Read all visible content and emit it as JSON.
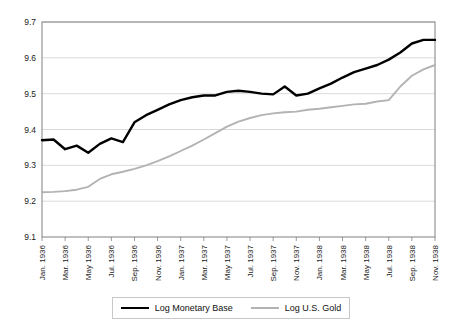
{
  "chart_data": {
    "type": "line",
    "title": "",
    "xlabel": "",
    "ylabel": "",
    "ylim": [
      9.1,
      9.7
    ],
    "yticks": [
      "9.1",
      "9.2",
      "9.3",
      "9.4",
      "9.5",
      "9.6",
      "9.7"
    ],
    "grid": true,
    "legend_position": "bottom",
    "x": [
      "Jan. 1936",
      "Feb. 1936",
      "Mar. 1936",
      "Apr. 1936",
      "May 1936",
      "Jun. 1936",
      "Jul. 1936",
      "Aug. 1936",
      "Sep. 1936",
      "Oct. 1936",
      "Nov. 1936",
      "Dec. 1936",
      "Jan. 1937",
      "Feb. 1937",
      "Mar. 1937",
      "Apr. 1937",
      "May 1937",
      "Jun. 1937",
      "Jul. 1937",
      "Aug. 1937",
      "Sep. 1937",
      "Oct. 1937",
      "Nov. 1937",
      "Dec. 1937",
      "Jan. 1938",
      "Feb. 1938",
      "Mar. 1938",
      "Apr. 1938",
      "May 1938",
      "Jun. 1938",
      "Jul. 1938",
      "Aug. 1938",
      "Sep. 1938",
      "Oct. 1938",
      "Nov. 1938"
    ],
    "xtick_labels": [
      "Jan. 1936",
      "Mar. 1936",
      "May 1936",
      "Jul. 1936",
      "Sep. 1936",
      "Nov. 1936",
      "Jan. 1937",
      "Mar. 1937",
      "May 1937",
      "Jul. 1937",
      "Sep. 1937",
      "Nov. 1937",
      "Jan. 1938",
      "Mar. 1938",
      "May 1938",
      "Jul. 1938",
      "Sep. 1938",
      "Nov. 1938"
    ],
    "series": [
      {
        "name": "Log Monetary Base",
        "color": "#000000",
        "values": [
          9.37,
          9.372,
          9.345,
          9.355,
          9.335,
          9.36,
          9.375,
          9.365,
          9.42,
          9.44,
          9.455,
          9.47,
          9.482,
          9.49,
          9.495,
          9.495,
          9.505,
          9.508,
          9.505,
          9.5,
          9.498,
          9.52,
          9.495,
          9.5,
          9.515,
          9.528,
          9.545,
          9.56,
          9.57,
          9.58,
          9.595,
          9.615,
          9.64,
          9.65,
          9.65
        ]
      },
      {
        "name": "Log U.S. Gold",
        "color": "#b3b3b3",
        "values": [
          9.225,
          9.226,
          9.228,
          9.232,
          9.24,
          9.262,
          9.275,
          9.282,
          9.29,
          9.3,
          9.312,
          9.325,
          9.34,
          9.355,
          9.372,
          9.39,
          9.408,
          9.422,
          9.432,
          9.44,
          9.445,
          9.448,
          9.45,
          9.455,
          9.458,
          9.462,
          9.466,
          9.47,
          9.472,
          9.478,
          9.482,
          9.52,
          9.55,
          9.568,
          9.58
        ]
      }
    ]
  },
  "legend": {
    "entries": [
      {
        "label": "Log Monetary Base",
        "color": "#000000"
      },
      {
        "label": "Log U.S. Gold",
        "color": "#b3b3b3"
      }
    ]
  }
}
